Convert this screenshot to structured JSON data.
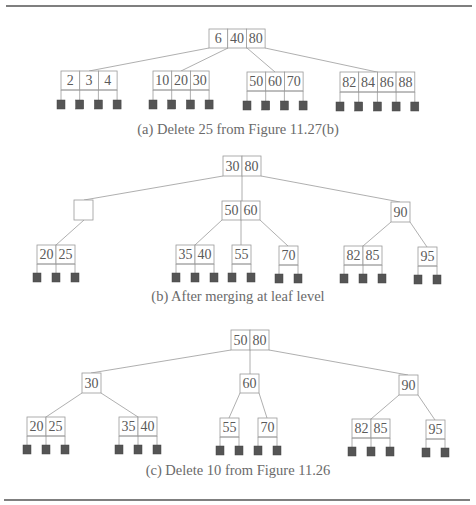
{
  "colors": {
    "rule": "#555555",
    "line": "#9a9a9a",
    "text": "#5a5a5a",
    "leaf_square": "#555555"
  },
  "rules": [
    {
      "x1": 6,
      "x2": 472,
      "y": 6
    },
    {
      "x1": 4,
      "x2": 470,
      "y": 500
    }
  ],
  "figures": [
    {
      "id": "a",
      "caption": "(a) Delete 25 from Figure 11.27(b)",
      "caption_pos": {
        "x": 238,
        "y": 134
      },
      "nodes": [
        {
          "id": "a-root",
          "keys": [
            "6",
            "40",
            "80"
          ],
          "x": 209,
          "y": 29,
          "cw": 18.7,
          "h": 19,
          "leaf": false
        },
        {
          "id": "a-l1",
          "keys": [
            "2",
            "3",
            "4"
          ],
          "x": 61,
          "y": 71,
          "cw": 18.7,
          "h": 19,
          "leaf": true,
          "ptr_h": 10
        },
        {
          "id": "a-l2",
          "keys": [
            "10",
            "20",
            "30"
          ],
          "x": 153,
          "y": 71,
          "cw": 18.7,
          "h": 19,
          "leaf": true,
          "ptr_h": 10
        },
        {
          "id": "a-l3",
          "keys": [
            "50",
            "60",
            "70"
          ],
          "x": 247,
          "y": 72,
          "cw": 18.7,
          "h": 19,
          "leaf": true,
          "ptr_h": 10
        },
        {
          "id": "a-l4",
          "keys": [
            "82",
            "84",
            "86",
            "88"
          ],
          "x": 340,
          "y": 72,
          "cw": 18.7,
          "h": 20,
          "leaf": true,
          "ptr_h": 10
        }
      ],
      "edges": [
        {
          "from": [
            209,
            48
          ],
          "to": [
            89,
            71
          ]
        },
        {
          "from": [
            228,
            48
          ],
          "to": [
            181,
            71
          ]
        },
        {
          "from": [
            247,
            48
          ],
          "to": [
            275,
            72
          ]
        },
        {
          "from": [
            265,
            48
          ],
          "to": [
            377,
            72
          ]
        }
      ]
    },
    {
      "id": "b",
      "caption": "(b) After merging at leaf level",
      "caption_pos": {
        "x": 238,
        "y": 301
      },
      "nodes": [
        {
          "id": "b-root",
          "keys": [
            "30",
            "80"
          ],
          "x": 223,
          "y": 156,
          "cw": 19,
          "h": 20,
          "leaf": false
        },
        {
          "id": "b-empty",
          "keys": [
            ""
          ],
          "x": 74,
          "y": 200,
          "cw": 19,
          "h": 20,
          "leaf": false
        },
        {
          "id": "b-5060",
          "keys": [
            "50",
            "60"
          ],
          "x": 222,
          "y": 201,
          "cw": 19,
          "h": 19,
          "leaf": false
        },
        {
          "id": "b-90",
          "keys": [
            "90"
          ],
          "x": 391,
          "y": 202,
          "cw": 19,
          "h": 20,
          "leaf": false
        },
        {
          "id": "b-l1",
          "keys": [
            "20",
            "25"
          ],
          "x": 37,
          "y": 245,
          "cw": 19,
          "h": 19,
          "leaf": true,
          "ptr_h": 9
        },
        {
          "id": "b-l2",
          "keys": [
            "35",
            "40"
          ],
          "x": 176,
          "y": 245,
          "cw": 19,
          "h": 19,
          "leaf": true,
          "ptr_h": 9
        },
        {
          "id": "b-l3",
          "keys": [
            "55"
          ],
          "x": 232,
          "y": 245,
          "cw": 19,
          "h": 19,
          "leaf": true,
          "ptr_h": 9
        },
        {
          "id": "b-l4",
          "keys": [
            "70"
          ],
          "x": 279,
          "y": 246,
          "cw": 19,
          "h": 19,
          "leaf": true,
          "ptr_h": 9
        },
        {
          "id": "b-l5",
          "keys": [
            "82",
            "85"
          ],
          "x": 344,
          "y": 246,
          "cw": 19,
          "h": 19,
          "leaf": true,
          "ptr_h": 9
        },
        {
          "id": "b-l6",
          "keys": [
            "95"
          ],
          "x": 418,
          "y": 247,
          "cw": 19,
          "h": 19,
          "leaf": true,
          "ptr_h": 9
        }
      ],
      "edges": [
        {
          "from": [
            223,
            176
          ],
          "to": [
            84,
            200
          ]
        },
        {
          "from": [
            242,
            176
          ],
          "to": [
            242,
            201
          ]
        },
        {
          "from": [
            261,
            176
          ],
          "to": [
            400,
            202
          ]
        },
        {
          "from": [
            84,
            220
          ],
          "to": [
            56,
            245
          ]
        },
        {
          "from": [
            222,
            220
          ],
          "to": [
            195,
            245
          ]
        },
        {
          "from": [
            241,
            220
          ],
          "to": [
            241,
            245
          ]
        },
        {
          "from": [
            260,
            220
          ],
          "to": [
            288,
            246
          ]
        },
        {
          "from": [
            391,
            222
          ],
          "to": [
            363,
            246
          ]
        },
        {
          "from": [
            410,
            222
          ],
          "to": [
            427,
            247
          ]
        }
      ]
    },
    {
      "id": "c",
      "caption": "(c) Delete 10 from Figure 11.26",
      "caption_pos": {
        "x": 238,
        "y": 475
      },
      "nodes": [
        {
          "id": "c-root",
          "keys": [
            "50",
            "80"
          ],
          "x": 231,
          "y": 330,
          "cw": 19,
          "h": 20,
          "leaf": false
        },
        {
          "id": "c-30",
          "keys": [
            "30"
          ],
          "x": 82,
          "y": 373,
          "cw": 19,
          "h": 20,
          "leaf": false
        },
        {
          "id": "c-60",
          "keys": [
            "60"
          ],
          "x": 240,
          "y": 374,
          "cw": 19,
          "h": 19,
          "leaf": false
        },
        {
          "id": "c-90",
          "keys": [
            "90"
          ],
          "x": 399,
          "y": 375,
          "cw": 19,
          "h": 20,
          "leaf": false
        },
        {
          "id": "c-l1",
          "keys": [
            "20",
            "25"
          ],
          "x": 27,
          "y": 417,
          "cw": 19,
          "h": 19,
          "leaf": true,
          "ptr_h": 9
        },
        {
          "id": "c-l2",
          "keys": [
            "35",
            "40"
          ],
          "x": 119,
          "y": 417,
          "cw": 19,
          "h": 19,
          "leaf": true,
          "ptr_h": 9
        },
        {
          "id": "c-l3",
          "keys": [
            "55"
          ],
          "x": 220,
          "y": 418,
          "cw": 19,
          "h": 19,
          "leaf": true,
          "ptr_h": 9
        },
        {
          "id": "c-l4",
          "keys": [
            "70"
          ],
          "x": 258,
          "y": 418,
          "cw": 19,
          "h": 19,
          "leaf": true,
          "ptr_h": 9
        },
        {
          "id": "c-l5",
          "keys": [
            "82",
            "85"
          ],
          "x": 352,
          "y": 419,
          "cw": 19,
          "h": 19,
          "leaf": true,
          "ptr_h": 9
        },
        {
          "id": "c-l6",
          "keys": [
            "95"
          ],
          "x": 426,
          "y": 420,
          "cw": 19,
          "h": 19,
          "leaf": true,
          "ptr_h": 9
        }
      ],
      "edges": [
        {
          "from": [
            231,
            350
          ],
          "to": [
            91,
            373
          ]
        },
        {
          "from": [
            250,
            350
          ],
          "to": [
            250,
            374
          ]
        },
        {
          "from": [
            269,
            350
          ],
          "to": [
            408,
            375
          ]
        },
        {
          "from": [
            82,
            393
          ],
          "to": [
            46,
            417
          ]
        },
        {
          "from": [
            101,
            393
          ],
          "to": [
            138,
            417
          ]
        },
        {
          "from": [
            240,
            393
          ],
          "to": [
            229,
            418
          ]
        },
        {
          "from": [
            259,
            393
          ],
          "to": [
            267,
            418
          ]
        },
        {
          "from": [
            399,
            395
          ],
          "to": [
            371,
            419
          ]
        },
        {
          "from": [
            418,
            395
          ],
          "to": [
            435,
            420
          ]
        }
      ]
    }
  ]
}
